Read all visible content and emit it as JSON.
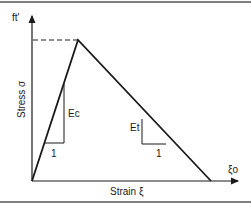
{
  "diagram": {
    "y_axis_top_label": "ft'",
    "y_axis_label": "Stress σ",
    "x_axis_label": "Strain ξ",
    "x_axis_end_label": "ξo",
    "ascending_slope_label": "Ec",
    "descending_slope_label": "Et",
    "ascending_run_label": "1",
    "descending_run_label": "1",
    "line_color": "#1a1a1a",
    "frame_color": "#555555"
  }
}
